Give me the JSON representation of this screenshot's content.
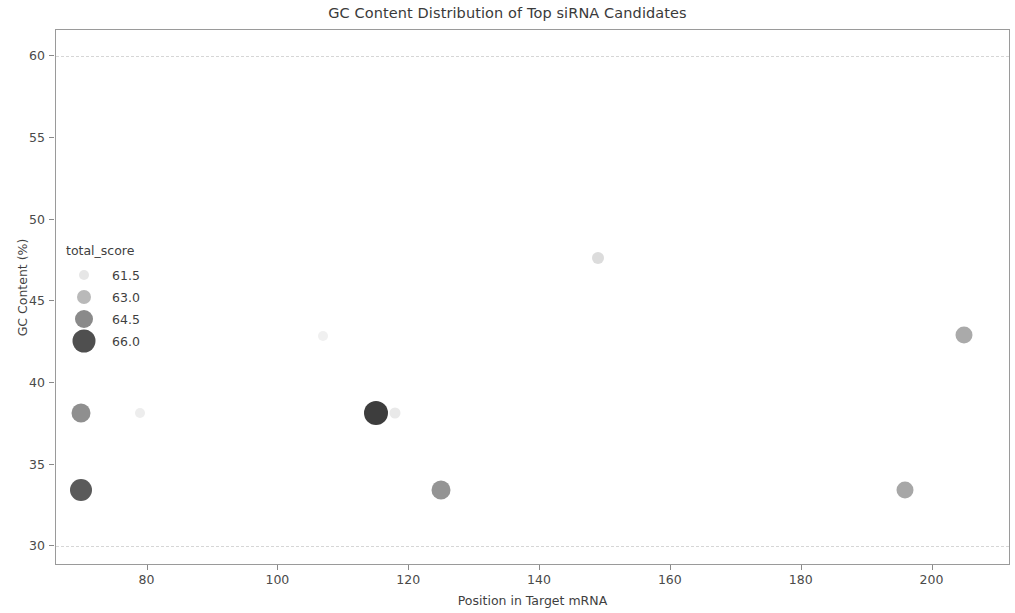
{
  "chart_data": {
    "type": "scatter",
    "title": "GC Content Distribution of Top siRNA Candidates",
    "xlabel": "Position in Target mRNA",
    "ylabel": "GC Content (%)",
    "xlim": [
      66,
      212
    ],
    "ylim": [
      28.8,
      61.6
    ],
    "xticks": [
      80,
      100,
      120,
      140,
      160,
      180,
      200
    ],
    "yticks": [
      30,
      35,
      40,
      45,
      50,
      55,
      60
    ],
    "grid": "horizontal-dashed-at-30-and-60",
    "gridlines_y": [
      30,
      60
    ],
    "legend": {
      "title": "total_score",
      "position": "upper-left-inside",
      "size_encoding": true,
      "color_encoding": true,
      "entries": [
        {
          "label": "61.5",
          "value": 61.5,
          "color": "#e6e6e6",
          "radius": 5
        },
        {
          "label": "63.0",
          "value": 63.0,
          "color": "#b9b9b9",
          "radius": 7
        },
        {
          "label": "64.5",
          "value": 64.5,
          "color": "#8a8a8a",
          "radius": 9
        },
        {
          "label": "66.0",
          "value": 66.0,
          "color": "#4f4f4f",
          "radius": 11.5
        }
      ]
    },
    "points": [
      {
        "x": 70,
        "y": 38.1,
        "total_score": 64.5,
        "color": "#8f8f8f",
        "radius": 9.5
      },
      {
        "x": 70,
        "y": 33.4,
        "total_score": 65.8,
        "color": "#5a5a5a",
        "radius": 11
      },
      {
        "x": 79,
        "y": 38.1,
        "total_score": 61.5,
        "color": "#ededed",
        "radius": 5
      },
      {
        "x": 107,
        "y": 42.8,
        "total_score": 61.5,
        "color": "#f0f0f0",
        "radius": 5
      },
      {
        "x": 115,
        "y": 38.1,
        "total_score": 66.0,
        "color": "#3d3d3d",
        "radius": 12
      },
      {
        "x": 118,
        "y": 38.1,
        "total_score": 61.7,
        "color": "#e9e9e9",
        "radius": 5.5
      },
      {
        "x": 125,
        "y": 33.4,
        "total_score": 64.3,
        "color": "#949494",
        "radius": 9.5
      },
      {
        "x": 149,
        "y": 47.6,
        "total_score": 62.0,
        "color": "#dcdcdc",
        "radius": 6
      },
      {
        "x": 196,
        "y": 33.4,
        "total_score": 63.6,
        "color": "#a7a7a7",
        "radius": 8.5
      },
      {
        "x": 205,
        "y": 42.9,
        "total_score": 63.4,
        "color": "#aaaaaa",
        "radius": 8.5
      }
    ]
  }
}
